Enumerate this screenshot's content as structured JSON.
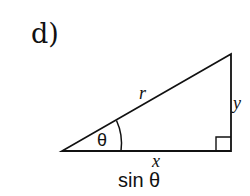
{
  "problem_label": "d)",
  "triangle": {
    "hypotenuse_label": "r",
    "opposite_label": "y",
    "adjacent_label": "x",
    "angle_label": "θ",
    "right_angle_marker": true
  },
  "caption": "sin θ"
}
